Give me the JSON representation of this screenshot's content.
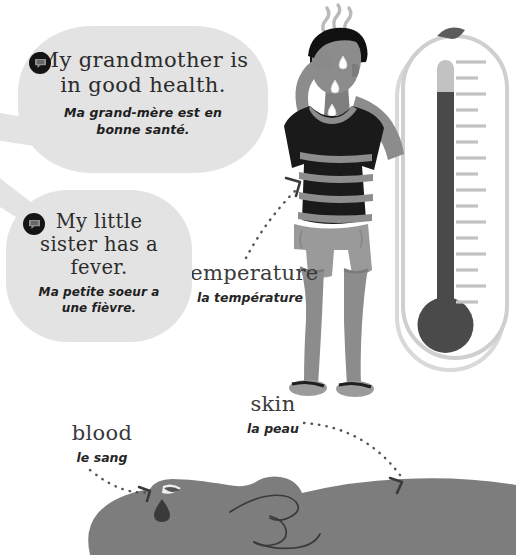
{
  "page": {
    "language_pair": "English / French"
  },
  "palette": {
    "bubble_bg": "#e3e3e3",
    "ink": "#2b2b2b",
    "skin": "#8c8c8c",
    "shirt_dark": "#1a1a1a",
    "shirt_stripe": "#8d8d8d",
    "shorts": "#9a9a9a",
    "hair": "#111111",
    "thermo_outline": "#c9c9c9",
    "thermo_mercury": "#4a4a4a",
    "thermo_tube": "#bcbcbc",
    "hand": "#7d7d7d",
    "dot_arrow": "#555555"
  },
  "bubbles": [
    {
      "icon": "speech-bubble-icon",
      "english": "My grandmother is in good health.",
      "english_lines": [
        "My grandmother is",
        "in good health."
      ],
      "french": "Ma grand-mère est en bonne santé.",
      "french_lines": [
        "Ma grand-mère est en",
        "bonne santé."
      ]
    },
    {
      "icon": "speech-bubble-icon",
      "english": "My little sister has a fever.",
      "english_lines": [
        "My little",
        "sister has a",
        "fever."
      ],
      "french": "Ma petite soeur a une fièvre.",
      "french_lines": [
        "Ma petite soeur a",
        "une fièvre."
      ]
    }
  ],
  "vocabulary": [
    {
      "english": "temperature",
      "french": "la température",
      "points_to": "feverish-man"
    },
    {
      "english": "skin",
      "french": "la peau",
      "points_to": "hand-skin"
    },
    {
      "english": "blood",
      "french": "le sang",
      "points_to": "blood-drop"
    }
  ],
  "illustrations": [
    {
      "name": "feverish-man",
      "description": "Man with hand on forehead, sweating, heat waves above head, dark striped t-shirt, gray shorts, flip-flops"
    },
    {
      "name": "thermometer",
      "description": "Large outlined thermometer with mercury column and tick marks",
      "tick_count": 16
    },
    {
      "name": "pointing-hand",
      "description": "Gray pointing hand with cut fingertip and falling blood drop"
    }
  ]
}
